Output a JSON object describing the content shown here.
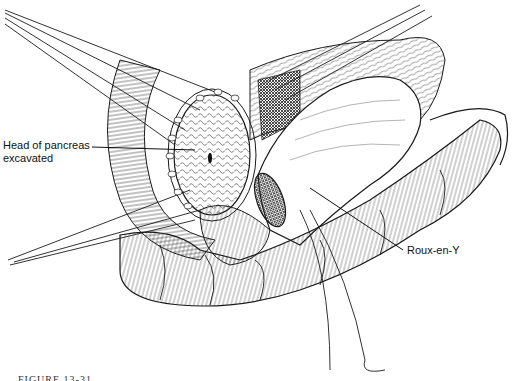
{
  "figure": {
    "type": "surgical illustration",
    "labels": {
      "pancreas_line1": "Head of pancreas",
      "pancreas_line2": "excavated",
      "roux": "Roux-en-Y"
    },
    "caption_partial": "FIGURE 13-31",
    "colors": {
      "ink": "#1a1a1a",
      "background": "#ffffff",
      "shade": "#3a3a3a"
    }
  }
}
